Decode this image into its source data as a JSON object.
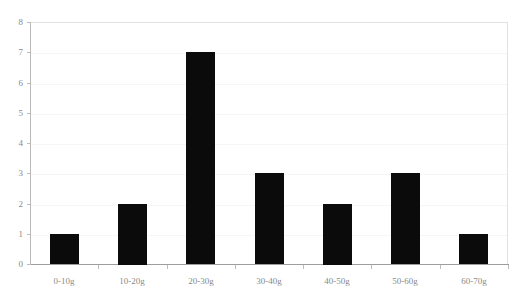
{
  "chart_data": {
    "type": "bar",
    "title": "",
    "subtitle": "",
    "xlabel": "",
    "ylabel": "",
    "categories": [
      "0-10g",
      "10-20g",
      "20-30g",
      "30-40g",
      "40-50g",
      "50-60g",
      "60-70g"
    ],
    "values": [
      1,
      2,
      7,
      3,
      2,
      3,
      1
    ],
    "ylim": [
      0,
      8
    ],
    "y_ticks": [
      0,
      1,
      2,
      3,
      4,
      5,
      6,
      7,
      8
    ],
    "y_tick_labels": [
      "0",
      "1",
      "2",
      "3",
      "4",
      "5",
      "6",
      "7",
      "8"
    ],
    "grid": true,
    "grid_axis": "y",
    "legend": false,
    "legend_position": "none",
    "bar_color": "#0b0b0b",
    "grid_color": "#f6f6f6",
    "axis_color": "#9e9e9e",
    "tick_label_color": "#8a8a8a",
    "background_color": "#ffffff"
  }
}
